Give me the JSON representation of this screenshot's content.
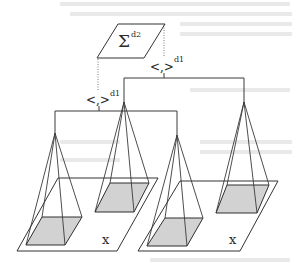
{
  "diagram": {
    "type": "hierarchical pyramid aggregation diagram",
    "top_node": {
      "symbol": "Σ",
      "superscript": "d2"
    },
    "inner_product_labels": [
      {
        "id": "right",
        "text": "<,>",
        "superscript": "d1"
      },
      {
        "id": "left",
        "text": "<,>",
        "superscript": "d1"
      }
    ],
    "planes": [
      {
        "id": "left-plane",
        "label": "x",
        "pyramids": 2
      },
      {
        "id": "right-plane",
        "label": "x",
        "pyramids": 2
      }
    ],
    "pyramid_count": 4,
    "colors": {
      "line": "#3a3a3a",
      "base_fill": "#d2d2d2",
      "background": "#ffffff"
    }
  }
}
